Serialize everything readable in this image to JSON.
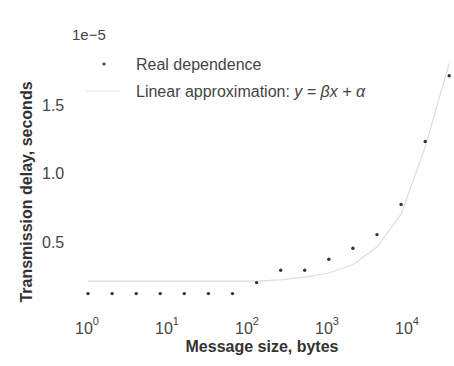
{
  "chart_data": {
    "type": "scatter",
    "title": "",
    "xlabel": "Message size, bytes",
    "ylabel": "Transmission delay, seconds",
    "xscale": "log",
    "y_offset_label": "1e−5",
    "xlim": [
      0.7,
      40000
    ],
    "ylim": [
      0.0,
      1.9
    ],
    "x_ticks": [
      1,
      10,
      100,
      1000,
      10000
    ],
    "x_tick_labels": [
      {
        "base": "10",
        "exp": "0"
      },
      {
        "base": "10",
        "exp": "1"
      },
      {
        "base": "10",
        "exp": "2"
      },
      {
        "base": "10",
        "exp": "3"
      },
      {
        "base": "10",
        "exp": "4"
      }
    ],
    "y_ticks": [
      0.5,
      1.0,
      1.5
    ],
    "y_tick_labels": [
      "0.5",
      "1.0",
      "1.5"
    ],
    "grid": false,
    "legend_position": "upper left",
    "series": [
      {
        "name": "Real dependence",
        "style": "dots",
        "color": "#333333",
        "x": [
          1,
          2,
          4,
          8,
          16,
          32,
          64,
          128,
          256,
          512,
          1024,
          2048,
          4096,
          8192,
          16384,
          32768
        ],
        "y": [
          0.12,
          0.12,
          0.12,
          0.12,
          0.12,
          0.12,
          0.12,
          0.2,
          0.29,
          0.29,
          0.37,
          0.45,
          0.55,
          0.77,
          1.23,
          1.71
        ]
      },
      {
        "name": "Linear approximation: y = βx + α",
        "style": "line",
        "color": "#dddddd",
        "x": [
          1,
          2,
          4,
          8,
          16,
          32,
          64,
          128,
          256,
          512,
          1024,
          2048,
          4096,
          8192,
          16384,
          32768
        ],
        "y": [
          0.21,
          0.21,
          0.21,
          0.21,
          0.21,
          0.21,
          0.21,
          0.21,
          0.22,
          0.24,
          0.27,
          0.33,
          0.46,
          0.7,
          1.19,
          1.8
        ]
      }
    ]
  },
  "legend": {
    "items": [
      {
        "label": "Real dependence"
      },
      {
        "label_prefix": "Linear approximation: ",
        "label_formula": "y = βx + α"
      }
    ]
  }
}
